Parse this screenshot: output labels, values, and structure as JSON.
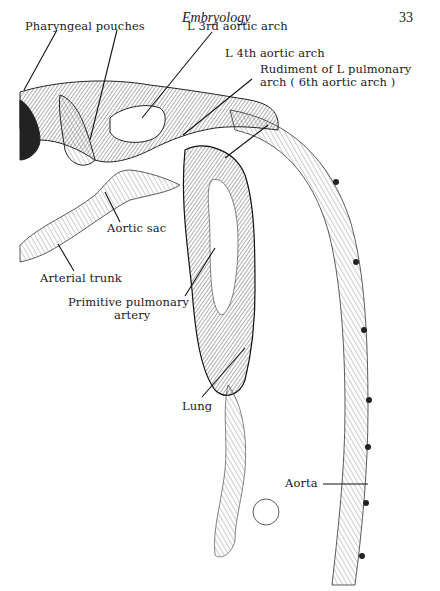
{
  "header": {
    "title": "Embryology",
    "page_number": "33"
  },
  "figure": {
    "labels": [
      {
        "id": "pharyngeal-pouches",
        "text": "Pharyngeal pouches"
      },
      {
        "id": "l-3rd-aortic-arch",
        "text": "L 3rd aortic arch"
      },
      {
        "id": "l-4th-aortic-arch",
        "text": "L 4th aortic arch"
      },
      {
        "id": "rudiment-l-pulmonary-arch-1",
        "text": "Rudiment of L pulmonary"
      },
      {
        "id": "rudiment-l-pulmonary-arch-2",
        "text": "arch ( 6th aortic arch )"
      },
      {
        "id": "aortic-sac",
        "text": "Aortic sac"
      },
      {
        "id": "arterial-trunk",
        "text": "Arterial trunk"
      },
      {
        "id": "primitive-pulmonary-artery-1",
        "text": "Primitive pulmonary"
      },
      {
        "id": "primitive-pulmonary-artery-2",
        "text": "artery"
      },
      {
        "id": "lung",
        "text": "Lung"
      },
      {
        "id": "aorta",
        "text": "Aorta"
      }
    ]
  }
}
